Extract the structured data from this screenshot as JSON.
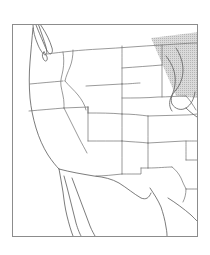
{
  "figure": {
    "type": "outline-map",
    "region_label": "Western and Central United States",
    "background_color": "#ffffff",
    "frame": {
      "x": 12.5,
      "y": 24.5,
      "width": 185,
      "height": 212,
      "stroke_color": "#8c8c8c",
      "stroke_width": 1,
      "fill_color": "#ffffff"
    },
    "geometry": {
      "coastline_color": "#5a5a5a",
      "coastline_width": 0.8,
      "border_color": "#6e6e6e",
      "border_width": 0.7,
      "land_fill": "#ffffff"
    },
    "overlay": {
      "name": "shaded-wedge",
      "shape": "triangular-cone",
      "fill_color": "#c9c9c9",
      "opacity": 0.85,
      "apex": [
        148,
        40
      ],
      "location_hint": "upper-right / Great Lakes",
      "points": "151,38 198,32 198,98 176,96"
    },
    "features": {
      "coast_pacific": "M 34,24 L 34,30 L 36,37 L 38,44 L 40,49 L 43,52 L 45,50 L 44,44 L 42,37 L 41,30 L 40,24 Z",
      "vancouver_island": "M 36,26 L 40,33 L 44,42 L 47,50 L 49,53 L 52,51 L 50,44 L 46,35 L 42,28 L 39,24 Z",
      "puget_sound": "M 45,50 L 48,55 L 45,58 L 43,55 Z",
      "mainland_coast": "M 33,30 L 32,40 L 31,52 L 30,64 L 29,76 L 29,88 L 30,100 L 32,112 L 35,124 L 39,136 L 43,146 L 48,154 L 53,161 L 57,166 L 60,170",
      "baja_outer": "M 58,170 L 61,180 L 63,190 L 64,200 L 66,210 L 69,220 L 72,229 L 75,236",
      "baja_inner": "M 62,174 L 65,184 L 67,194 L 69,204 L 72,214 L 75,224 L 78,232 L 80,236",
      "gulf_california_east": "M 70,180 L 74,190 L 78,200 L 82,210 L 86,220 L 90,228 L 94,236",
      "gulf_coast_texas": "M 150,190 L 156,196 L 160,204 L 163,212 L 165,220 L 167,228 L 168,236",
      "mexico_border": "M 60,170 L 72,173 L 86,176 L 100,178 L 112,180 L 120,184 L 128,190 L 136,196 L 144,200 L 150,196",
      "gulf_of_mexico_east": "M 170,200 L 180,206 L 190,214 L 197,220"
    },
    "state_borders": [
      "M 12.5,58 L 24,56 L 40,55 L 56,54 L 72,53 L 90,52 L 108,51 L 126,50 L 144,49 L 162,48 L 180,47 L 197,46",
      "M 12.5,96 L 26,94 L 42,93 L 58,92 L 74,91",
      "M 58,24 L 59,32 L 62,38 L 64,45 L 66,52 L 68,58",
      "M 68,58 L 66,64 L 64,72 L 63,80 L 63,90 L 63,100 L 64,110 L 66,118 L 68,126",
      "M 90,24 L 90,35 L 90,46 L 90,56",
      "M 124,24 L 124,36 L 124,48",
      "M 162,24 L 162,36 L 162,44",
      "M 74,52 L 74,66 L 74,80 L 74,94 L 74,108 L 74,122 L 74,136 L 74,150 L 74,164",
      "M 96,52 L 96,66 L 96,80 L 96,92",
      "M 96,92 L 110,92 L 124,92 L 138,92 L 152,92",
      "M 96,80 L 110,80 L 124,80 L 138,80",
      "M 96,80 L 96,66 L 96,54",
      "M 138,48 L 138,62 L 138,76 L 138,90",
      "M 152,46 L 152,58 L 152,70 L 152,82",
      "M 152,82 L 166,81 L 180,80 L 197,79",
      "M 152,110 L 166,109 L 180,108 L 197,107",
      "M 152,92 L 152,110 L 152,128",
      "M 74,122 L 88,122 L 102,122 L 116,122 L 130,122 L 144,122 L 152,122",
      "M 110,122 L 110,134 L 110,146 L 110,158",
      "M 74,150 L 88,150 L 102,150 L 110,150",
      "M 110,150 L 124,150 L 138,150 L 150,150",
      "M 138,122 L 138,136 L 138,150",
      "M 152,128 L 166,127 L 180,126 L 197,125",
      "M 152,128 L 152,142 L 152,152 L 150,160",
      "M 166,140 L 180,139 L 197,138",
      "M 166,160 L 180,159 L 197,158",
      "M 166,127 L 166,140 L 166,160 L 168,176",
      "M 180,176 L 190,184 L 197,190",
      "M 12.5,140 L 24,138 L 40,137",
      "M 40,137 L 42,148 L 44,158",
      "M 63,100 L 74,100",
      "M 96,52 L 110,51 L 124,50",
      "M 110,92 L 110,106 L 110,122"
    ],
    "great_lakes": {
      "michigan_outline": "M 176,52 L 180,58 L 182,66 L 180,74 L 176,80 L 172,84 L 170,92 L 174,98 L 180,100 L 186,98 L 190,92 L 192,84 L 190,74 L 186,64 L 182,56 L 178,50 Z",
      "lake_edge": "M 168,60 L 174,64 L 178,72 L 177,82 L 172,90 L 170,98 L 174,104"
    }
  }
}
